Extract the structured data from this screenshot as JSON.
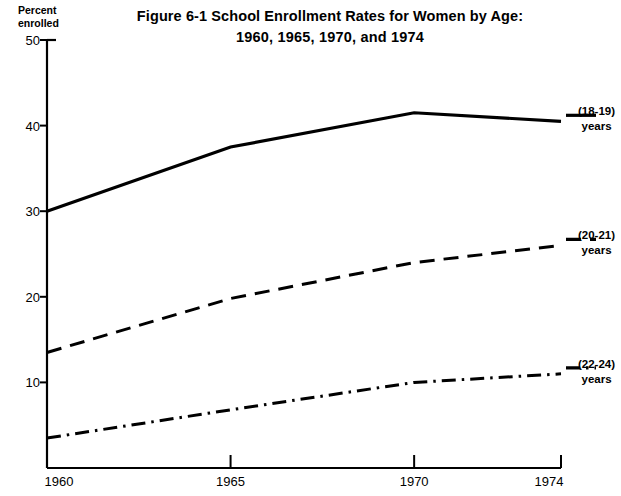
{
  "title": {
    "line1": "Figure 6-1  School Enrollment Rates for Women by Age:",
    "line2": "1960, 1965, 1970, and 1974"
  },
  "axis_caption": {
    "line1": "Percent",
    "line2": "enrolled"
  },
  "series_labels": [
    {
      "range": "(18-19)",
      "unit": "years"
    },
    {
      "range": "(20-21)",
      "unit": "years"
    },
    {
      "range": "(22-24)",
      "unit": "years"
    }
  ],
  "chart_data": {
    "type": "line",
    "title": "Figure 6-1  School Enrollment Rates for Women by Age: 1960, 1965, 1970, and 1974",
    "xlabel": "",
    "ylabel": "Percent enrolled",
    "x": [
      1960,
      1965,
      1970,
      1974
    ],
    "xticklabels": [
      "1960",
      "1965",
      "1970",
      "1974"
    ],
    "yticks": [
      10,
      20,
      30,
      40,
      50
    ],
    "yticklabels": [
      "10",
      "20",
      "30",
      "40",
      "50"
    ],
    "xlim": [
      1960,
      1974
    ],
    "ylim": [
      0,
      50
    ],
    "grid": false,
    "legend": "right-inline",
    "series": [
      {
        "name": "(18-19) years",
        "style": "solid",
        "color": "#000000",
        "values": [
          30.0,
          37.5,
          41.5,
          40.5
        ]
      },
      {
        "name": "(20-21) years",
        "style": "dashed",
        "color": "#000000",
        "values": [
          13.5,
          19.8,
          24.0,
          26.0
        ]
      },
      {
        "name": "(22-24) years",
        "style": "dashdot",
        "color": "#000000",
        "values": [
          3.5,
          6.8,
          10.0,
          11.0
        ]
      }
    ]
  }
}
